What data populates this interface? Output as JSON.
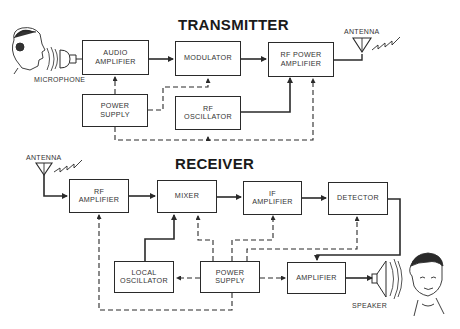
{
  "transmitter": {
    "title": "TRANSMITTER",
    "blocks": {
      "audio_amplifier": "AUDIO AMPLIFIER",
      "modulator": "MODULATOR",
      "rf_power_amplifier": "RF POWER AMPLIFIER",
      "power_supply": "POWER SUPPLY",
      "rf_oscillator": "RF OSCILLATOR"
    },
    "labels": {
      "microphone": "MICROPHONE",
      "antenna": "ANTENNA"
    }
  },
  "receiver": {
    "title": "RECEIVER",
    "blocks": {
      "rf_amplifier": "RF AMPLIFIER",
      "mixer": "MIXER",
      "if_amplifier": "IF AMPLIFIER",
      "detector": "DETECTOR",
      "local_oscillator": "LOCAL OSCILLATOR",
      "power_supply": "POWER SUPPLY",
      "amplifier": "AMPLIFIER"
    },
    "labels": {
      "antenna": "ANTENNA",
      "speaker": "SPEAKER"
    }
  },
  "legend": {
    "signal_path": "solid line",
    "power_path": "dashed line"
  },
  "colors": {
    "line": "#2a2a2a",
    "background": "#ffffff"
  }
}
